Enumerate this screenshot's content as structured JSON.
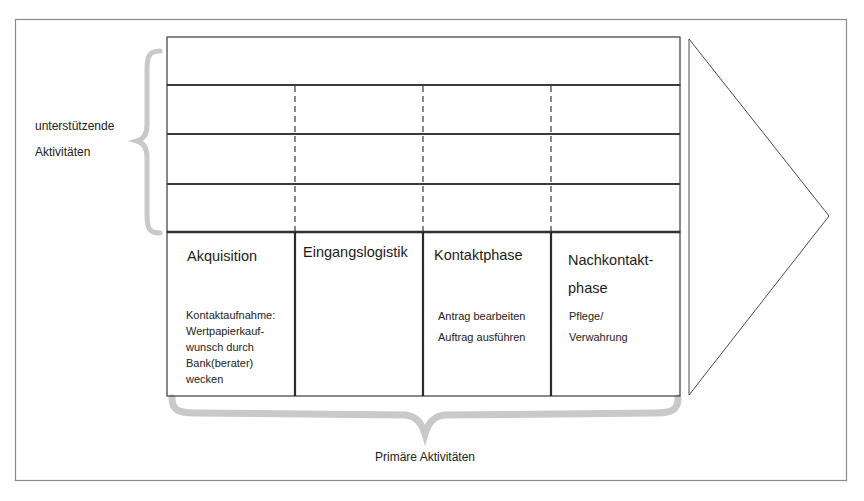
{
  "diagram": {
    "type": "value-chain",
    "support_label": {
      "line1": "unterstützende",
      "line2": "Aktivitäten"
    },
    "primary_label": "Primäre Aktivitäten",
    "support_rows": 4,
    "primary_activities": [
      {
        "title": "Akquisition",
        "details": [
          "Kontaktaufnahme:",
          "Wertpapierkauf-",
          "wunsch durch",
          "Bank(berater)",
          "wecken"
        ]
      },
      {
        "title": "Eingangslogistik",
        "details": []
      },
      {
        "title": "Kontaktphase",
        "details": [
          "Antrag bearbeiten",
          "Auftrag ausführen"
        ]
      },
      {
        "title_lines": [
          "Nachkontakt-",
          "phase"
        ],
        "details": [
          "Pflege/",
          "Verwahrung"
        ]
      }
    ],
    "colors": {
      "line": "#3a3a3a",
      "brace": "#c9c9c9",
      "frame": "#8a8a8a",
      "background": "#ffffff"
    }
  }
}
